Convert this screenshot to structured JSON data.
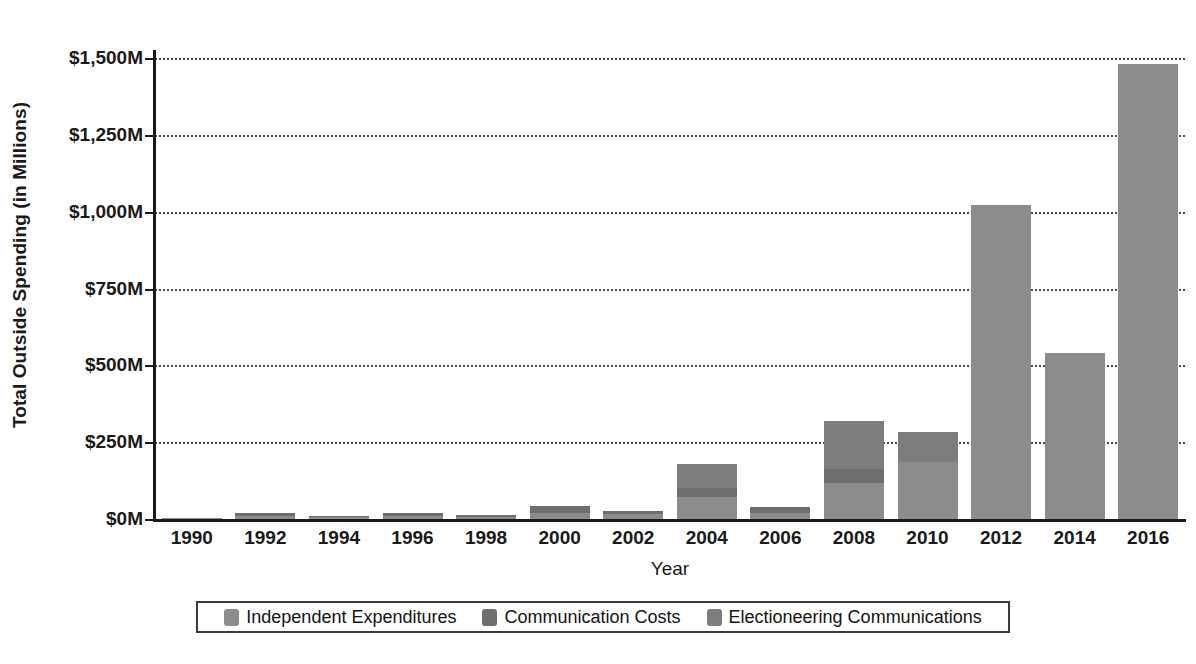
{
  "chart_data": {
    "type": "bar",
    "subtype": "stacked-bar",
    "title": "",
    "xlabel": "Year",
    "ylabel": "Total Outside Spending (in Millions)",
    "categories": [
      "1990",
      "1992",
      "1994",
      "1996",
      "1998",
      "2000",
      "2002",
      "2004",
      "2006",
      "2008",
      "2010",
      "2012",
      "2014",
      "2016"
    ],
    "series": [
      {
        "name": "Independent Expenditures",
        "color": "#8c8c8c",
        "values": [
          1,
          10,
          5,
          10,
          8,
          21,
          16,
          72,
          18,
          117,
          186,
          1022,
          540,
          1482
        ]
      },
      {
        "name": "Communication Costs",
        "color": "#6e6e6e",
        "values": [
          0,
          8,
          3,
          9,
          6,
          22,
          10,
          29,
          20,
          46,
          0,
          0,
          0,
          0
        ]
      },
      {
        "name": "Electioneering Communications",
        "color": "#7d7d7d",
        "values": [
          0,
          0,
          0,
          0,
          0,
          0,
          0,
          79,
          0,
          155,
          97,
          0,
          0,
          0
        ]
      }
    ],
    "totals": [
      1,
      18,
      8,
      19,
      14,
      43,
      26,
      180,
      38,
      318,
      283,
      1022,
      540,
      1482
    ],
    "ylim": [
      0,
      1500
    ],
    "yticks": [
      0,
      250,
      500,
      750,
      1000,
      1250,
      1500
    ],
    "ytick_labels": [
      "$0M",
      "$250M",
      "$500M",
      "$750M",
      "$1,000M",
      "$1,250M",
      "$1,500M"
    ],
    "grid": true,
    "grid_style": "dotted-horizontal",
    "legend_position": "bottom",
    "legend_entries": [
      "Independent Expenditures",
      "Communication Costs",
      "Electioneering Communications"
    ]
  },
  "axes": {
    "y_title": "Total Outside Spending (in Millions)",
    "x_title": "Year"
  },
  "colors": {
    "independent_expenditures": "#8c8c8c",
    "communication_costs": "#6e6e6e",
    "electioneering_communications": "#7d7d7d",
    "axis": "#1a1a1a",
    "grid": "#4a4a4a",
    "background": "#ffffff"
  }
}
